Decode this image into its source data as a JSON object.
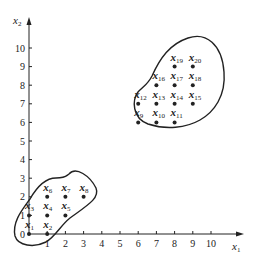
{
  "chart_data": {
    "type": "scatter",
    "title": "",
    "xlabel": "x1",
    "ylabel": "x2",
    "xlabel_main": "x",
    "xlabel_sub": "1",
    "ylabel_main": "x",
    "ylabel_sub": "2",
    "xlim": [
      0,
      10
    ],
    "ylim": [
      0,
      10
    ],
    "x_ticks": [
      "1",
      "2",
      "3",
      "4",
      "5",
      "6",
      "7",
      "8",
      "9",
      "10"
    ],
    "y_ticks": [
      "0",
      "1",
      "2",
      "3",
      "4",
      "5",
      "6",
      "7",
      "8",
      "9",
      "10"
    ],
    "grid": false,
    "points": [
      {
        "label": "x1",
        "main": "x",
        "sub": "1",
        "x": 0,
        "y": 0,
        "cluster": 1
      },
      {
        "label": "x2",
        "main": "x",
        "sub": "2",
        "x": 1,
        "y": 0,
        "cluster": 1
      },
      {
        "label": "x3",
        "main": "x",
        "sub": "3",
        "x": 0,
        "y": 1,
        "cluster": 1
      },
      {
        "label": "x4",
        "main": "x",
        "sub": "4",
        "x": 1,
        "y": 1,
        "cluster": 1
      },
      {
        "label": "x5",
        "main": "x",
        "sub": "5",
        "x": 2,
        "y": 1,
        "cluster": 1
      },
      {
        "label": "x6",
        "main": "x",
        "sub": "6",
        "x": 1,
        "y": 2,
        "cluster": 1
      },
      {
        "label": "x7",
        "main": "x",
        "sub": "7",
        "x": 2,
        "y": 2,
        "cluster": 1
      },
      {
        "label": "x8",
        "main": "x",
        "sub": "8",
        "x": 3,
        "y": 2,
        "cluster": 1
      },
      {
        "label": "x9",
        "main": "x",
        "sub": "9",
        "x": 6,
        "y": 6,
        "cluster": 2
      },
      {
        "label": "x10",
        "main": "x",
        "sub": "10",
        "x": 7,
        "y": 6,
        "cluster": 2
      },
      {
        "label": "x11",
        "main": "x",
        "sub": "11",
        "x": 8,
        "y": 6,
        "cluster": 2
      },
      {
        "label": "x12",
        "main": "x",
        "sub": "12",
        "x": 6,
        "y": 7,
        "cluster": 2
      },
      {
        "label": "x13",
        "main": "x",
        "sub": "13",
        "x": 7,
        "y": 7,
        "cluster": 2
      },
      {
        "label": "x14",
        "main": "x",
        "sub": "14",
        "x": 8,
        "y": 7,
        "cluster": 2
      },
      {
        "label": "x15",
        "main": "x",
        "sub": "15",
        "x": 9,
        "y": 7,
        "cluster": 2
      },
      {
        "label": "x16",
        "main": "x",
        "sub": "16",
        "x": 7,
        "y": 8,
        "cluster": 2
      },
      {
        "label": "x17",
        "main": "x",
        "sub": "17",
        "x": 8,
        "y": 8,
        "cluster": 2
      },
      {
        "label": "x18",
        "main": "x",
        "sub": "18",
        "x": 9,
        "y": 8,
        "cluster": 2
      },
      {
        "label": "x19",
        "main": "x",
        "sub": "19",
        "x": 8,
        "y": 9,
        "cluster": 2
      },
      {
        "label": "x20",
        "main": "x",
        "sub": "20",
        "x": 9,
        "y": 9,
        "cluster": 2
      }
    ],
    "clusters": [
      {
        "name": "cluster-1",
        "members": [
          "x1",
          "x2",
          "x3",
          "x4",
          "x5",
          "x6",
          "x7",
          "x8"
        ]
      },
      {
        "name": "cluster-2",
        "members": [
          "x9",
          "x10",
          "x11",
          "x12",
          "x13",
          "x14",
          "x15",
          "x16",
          "x17",
          "x18",
          "x19",
          "x20"
        ]
      }
    ]
  },
  "colors": {
    "ink": "#222222",
    "background": "#ffffff"
  }
}
